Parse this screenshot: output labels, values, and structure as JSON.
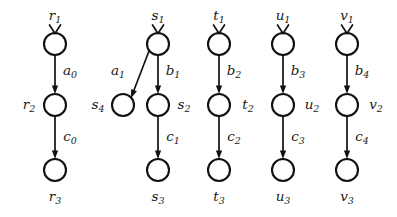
{
  "diagram": {
    "colors": {
      "stroke": "#111111",
      "node_fill": "#ffffff",
      "background": "#ffffff",
      "text": "#1a1a1a"
    },
    "nodes": [
      {
        "id": "r1",
        "base": "r",
        "sub": "1",
        "cx": 55,
        "cy": 44,
        "r": 11,
        "label_x": 55,
        "label_y": 16,
        "has_entry_mark": true
      },
      {
        "id": "r2",
        "base": "r",
        "sub": "2",
        "cx": 55,
        "cy": 105,
        "r": 11,
        "label_x": 29,
        "label_y": 105,
        "has_entry_mark": false
      },
      {
        "id": "r3",
        "base": "r",
        "sub": "3",
        "cx": 55,
        "cy": 170,
        "r": 11,
        "label_x": 55,
        "label_y": 197,
        "has_entry_mark": false
      },
      {
        "id": "s1",
        "base": "s",
        "sub": "1",
        "cx": 158,
        "cy": 44,
        "r": 11,
        "label_x": 158,
        "label_y": 16,
        "has_entry_mark": true
      },
      {
        "id": "s4",
        "base": "s",
        "sub": "4",
        "cx": 123,
        "cy": 105,
        "r": 11,
        "label_x": 98,
        "label_y": 105,
        "has_entry_mark": false
      },
      {
        "id": "s2",
        "base": "s",
        "sub": "2",
        "cx": 158,
        "cy": 105,
        "r": 11,
        "label_x": 184,
        "label_y": 105,
        "has_entry_mark": false
      },
      {
        "id": "s3",
        "base": "s",
        "sub": "3",
        "cx": 158,
        "cy": 170,
        "r": 11,
        "label_x": 158,
        "label_y": 197,
        "has_entry_mark": false
      },
      {
        "id": "t1",
        "base": "t",
        "sub": "1",
        "cx": 219,
        "cy": 44,
        "r": 11,
        "label_x": 219,
        "label_y": 16,
        "has_entry_mark": true
      },
      {
        "id": "t2",
        "base": "t",
        "sub": "2",
        "cx": 219,
        "cy": 105,
        "r": 11,
        "label_x": 248,
        "label_y": 105,
        "has_entry_mark": false
      },
      {
        "id": "t3",
        "base": "t",
        "sub": "3",
        "cx": 219,
        "cy": 170,
        "r": 11,
        "label_x": 219,
        "label_y": 197,
        "has_entry_mark": false
      },
      {
        "id": "u1",
        "base": "u",
        "sub": "1",
        "cx": 283,
        "cy": 44,
        "r": 11,
        "label_x": 283,
        "label_y": 16,
        "has_entry_mark": true
      },
      {
        "id": "u2",
        "base": "u",
        "sub": "2",
        "cx": 283,
        "cy": 105,
        "r": 11,
        "label_x": 312,
        "label_y": 105,
        "has_entry_mark": false
      },
      {
        "id": "u3",
        "base": "u",
        "sub": "3",
        "cx": 283,
        "cy": 170,
        "r": 11,
        "label_x": 283,
        "label_y": 197,
        "has_entry_mark": false
      },
      {
        "id": "v1",
        "base": "v",
        "sub": "1",
        "cx": 347,
        "cy": 44,
        "r": 11,
        "label_x": 347,
        "label_y": 16,
        "has_entry_mark": true
      },
      {
        "id": "v2",
        "base": "v",
        "sub": "2",
        "cx": 347,
        "cy": 105,
        "r": 11,
        "label_x": 376,
        "label_y": 105,
        "has_entry_mark": false
      },
      {
        "id": "v3",
        "base": "v",
        "sub": "3",
        "cx": 347,
        "cy": 170,
        "r": 11,
        "label_x": 347,
        "label_y": 197,
        "has_entry_mark": false
      }
    ],
    "edges": [
      {
        "id": "e-a0",
        "from": "r1",
        "to": "r2",
        "base": "a",
        "sub": "0",
        "x1": 55,
        "y1": 55,
        "x2": 55,
        "y2": 94,
        "label_x": 70,
        "label_y": 71
      },
      {
        "id": "e-c0",
        "from": "r2",
        "to": "r3",
        "base": "c",
        "sub": "0",
        "x1": 55,
        "y1": 116,
        "x2": 55,
        "y2": 159,
        "label_x": 70,
        "label_y": 137
      },
      {
        "id": "e-a1",
        "from": "s1",
        "to": "s4",
        "base": "a",
        "sub": "1",
        "x1": 149,
        "y1": 51,
        "x2": 131,
        "y2": 98,
        "label_x": 118,
        "label_y": 71
      },
      {
        "id": "e-b1",
        "from": "s1",
        "to": "s2",
        "base": "b",
        "sub": "1",
        "x1": 158,
        "y1": 55,
        "x2": 158,
        "y2": 94,
        "label_x": 173,
        "label_y": 71
      },
      {
        "id": "e-c1",
        "from": "s2",
        "to": "s3",
        "base": "c",
        "sub": "1",
        "x1": 158,
        "y1": 116,
        "x2": 158,
        "y2": 159,
        "label_x": 173,
        "label_y": 137
      },
      {
        "id": "e-b2",
        "from": "t1",
        "to": "t2",
        "base": "b",
        "sub": "2",
        "x1": 219,
        "y1": 55,
        "x2": 219,
        "y2": 94,
        "label_x": 234,
        "label_y": 71
      },
      {
        "id": "e-c2",
        "from": "t2",
        "to": "t3",
        "base": "c",
        "sub": "2",
        "x1": 219,
        "y1": 116,
        "x2": 219,
        "y2": 159,
        "label_x": 234,
        "label_y": 137
      },
      {
        "id": "e-b3",
        "from": "u1",
        "to": "u2",
        "base": "b",
        "sub": "3",
        "x1": 283,
        "y1": 55,
        "x2": 283,
        "y2": 94,
        "label_x": 298,
        "label_y": 71
      },
      {
        "id": "e-c3",
        "from": "u2",
        "to": "u3",
        "base": "c",
        "sub": "3",
        "x1": 283,
        "y1": 116,
        "x2": 283,
        "y2": 159,
        "label_x": 298,
        "label_y": 137
      },
      {
        "id": "e-b4",
        "from": "v1",
        "to": "v2",
        "base": "b",
        "sub": "4",
        "x1": 347,
        "y1": 55,
        "x2": 347,
        "y2": 94,
        "label_x": 362,
        "label_y": 71
      },
      {
        "id": "e-c4",
        "from": "v2",
        "to": "v3",
        "base": "c",
        "sub": "4",
        "x1": 347,
        "y1": 116,
        "x2": 347,
        "y2": 159,
        "label_x": 362,
        "label_y": 137
      }
    ]
  }
}
